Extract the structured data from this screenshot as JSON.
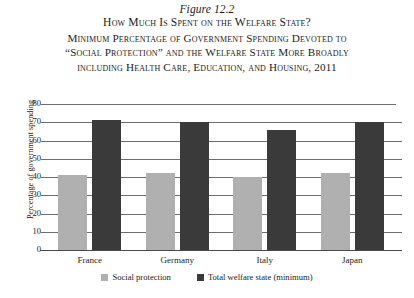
{
  "figure": {
    "number": "Figure 12.2",
    "title_lines": [
      "How Much Is Spent on the Welfare State?",
      "Minimum Percentage of Government Spending Devoted to",
      "“Social Protection” and the Welfare State More Broadly",
      "including Health Care, Education, and Housing, 2011"
    ]
  },
  "colors": {
    "social_protection": "#b0b0b0",
    "total_welfare_state": "#3a3a3a",
    "gridline": "#6e6e6e",
    "axis": "#4a4a4a",
    "background": "#ffffff",
    "text": "#1c1c1c"
  },
  "chart_data": {
    "type": "bar",
    "xlabel": "",
    "ylabel": "Percentage of government spending",
    "categories": [
      "France",
      "Germany",
      "Italy",
      "Japan"
    ],
    "series": [
      {
        "name": "Social protection",
        "values": [
          41,
          42,
          40,
          42
        ]
      },
      {
        "name": "Total welfare state (minimum)",
        "values": [
          71,
          70,
          66,
          70
        ]
      }
    ],
    "ylim": [
      0,
      80
    ],
    "ytick_values": [
      0,
      10,
      20,
      30,
      40,
      50,
      60,
      70,
      80
    ],
    "ytick_labels": [
      "0",
      "10",
      "20",
      "30",
      "40",
      "50",
      "60",
      "70",
      "80"
    ],
    "grid": true,
    "legend_position": "bottom"
  }
}
